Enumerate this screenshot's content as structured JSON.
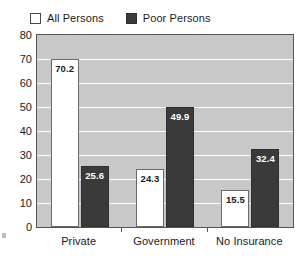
{
  "legend": {
    "entries": [
      {
        "label": "All Persons",
        "swatch": "open-square-icon",
        "color": "#ffffff"
      },
      {
        "label": "Poor Persons",
        "swatch": "filled-square-icon",
        "color": "#3a3a3a"
      }
    ]
  },
  "axes": {
    "y_ticks": [
      "80",
      "70",
      "60",
      "50",
      "40",
      "30",
      "20",
      "10",
      "0"
    ],
    "x_categories": [
      "Private",
      "Government",
      "No Insurance"
    ]
  },
  "colors": {
    "plot_background": "#c8c8c8",
    "gridline": "#ffffff",
    "all_persons_bar": "#ffffff",
    "poor_persons_bar": "#3a3a3a",
    "axis_line": "#555555",
    "text": "#1a1a1a"
  },
  "chart_data": {
    "type": "bar",
    "title": "",
    "subtitle": "",
    "xlabel": "",
    "ylabel": "",
    "ylim": [
      0,
      80
    ],
    "ytick_step": 10,
    "grid": true,
    "legend_position": "top-left",
    "categories": [
      "Private",
      "Government",
      "No Insurance"
    ],
    "series": [
      {
        "name": "All Persons",
        "values": [
          70.2,
          24.3,
          15.5
        ]
      },
      {
        "name": "Poor Persons",
        "values": [
          25.6,
          49.9,
          32.4
        ]
      }
    ],
    "value_labels": [
      "70.2",
      "25.6",
      "24.3",
      "49.9",
      "15.5",
      "32.4"
    ]
  }
}
